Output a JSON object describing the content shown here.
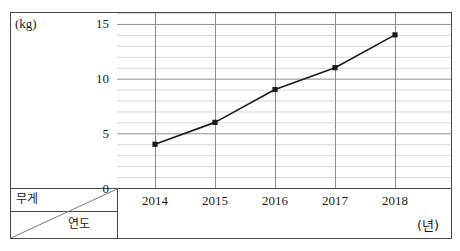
{
  "chart_data": {
    "type": "line",
    "title": "",
    "xlabel": "연도",
    "ylabel": "무게",
    "x_unit": "(년)",
    "y_unit": "(kg)",
    "categories": [
      "2014",
      "2015",
      "2016",
      "2017",
      "2018"
    ],
    "values": [
      4,
      6,
      9,
      11,
      14
    ],
    "series": [
      {
        "name": "무게",
        "values": [
          4,
          6,
          9,
          11,
          14
        ]
      }
    ],
    "ylim": [
      0,
      16
    ],
    "y_ticks": [
      0,
      5,
      10,
      15
    ],
    "y_tick_labels": [
      "0",
      "5",
      "10",
      "15"
    ],
    "y_minor_step": 1,
    "grid": true,
    "legend": "none",
    "marker": "filled-square",
    "line_color": "#1a1a1a",
    "marker_color": "#1a1a1a",
    "grid_major_color": "#8c8c8c",
    "grid_minor_color": "#d8d8d8",
    "frame_color": "#4a4a4a"
  },
  "corner": {
    "row_label": "무게",
    "column_label": "연도"
  },
  "axis": {
    "y_unit_label": "(kg)",
    "x_unit_label": "(년)"
  }
}
